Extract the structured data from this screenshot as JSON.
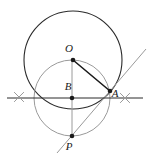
{
  "figure": {
    "canvas": {
      "width": 151,
      "height": 163,
      "background": "#ffffff"
    },
    "colors": {
      "primary_stroke": "#2b2b2b",
      "secondary_stroke": "#9a9a9a",
      "point_fill": "#1a1a1a",
      "label_color": "#1a1a1a",
      "background": "#ffffff"
    },
    "points": [
      {
        "id": "O",
        "label": "O",
        "x": 73,
        "y": 60,
        "label_x": 69,
        "label_y": 52,
        "role": "center-of-large-circle"
      },
      {
        "id": "B",
        "label": "B",
        "x": 72,
        "y": 98,
        "label_x": 68,
        "label_y": 90,
        "role": "center-of-small-circle"
      },
      {
        "id": "A",
        "label": "A",
        "x": 110,
        "y": 91,
        "label_x": 115,
        "label_y": 97,
        "role": "intersection-point"
      },
      {
        "id": "P",
        "label": "P",
        "x": 72,
        "y": 136,
        "label_x": 69,
        "label_y": 150,
        "role": "lower-intersection"
      }
    ],
    "circles": [
      {
        "id": "large-circle",
        "cx": 73,
        "cy": 60,
        "r": 49,
        "stroke": "#2b2b2b",
        "stroke_width": 1.1
      },
      {
        "id": "small-circle",
        "cx": 72,
        "cy": 98,
        "r": 38,
        "stroke": "#9a9a9a",
        "stroke_width": 1.0
      }
    ],
    "lines": [
      {
        "id": "horizontal-line",
        "x1": 7,
        "y1": 98,
        "x2": 143,
        "y2": 98,
        "stroke": "#2b2b2b",
        "stroke_width": 1.0
      },
      {
        "id": "vertical-line",
        "x1": 72,
        "y1": 59,
        "x2": 72,
        "y2": 137,
        "stroke": "#9a9a9a",
        "stroke_width": 1.0
      },
      {
        "id": "diagonal-ray",
        "x1": 57,
        "y1": 153,
        "x2": 146,
        "y2": 49,
        "stroke": "#9a9a9a",
        "stroke_width": 1.0
      },
      {
        "id": "radius-segment-OA",
        "x1": 73,
        "y1": 60,
        "x2": 110,
        "y2": 91,
        "stroke": "#1a1a1a",
        "stroke_width": 1.6
      }
    ],
    "tick_marks": [
      {
        "id": "left-tick",
        "cx": 19,
        "cy": 97,
        "size": 7,
        "stroke": "#9a9a9a"
      },
      {
        "id": "right-tick",
        "cx": 125,
        "cy": 98,
        "size": 7,
        "stroke": "#9a9a9a"
      }
    ]
  }
}
